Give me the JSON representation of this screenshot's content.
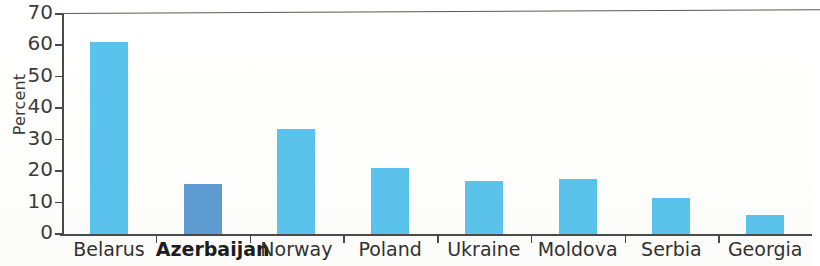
{
  "chart_data": {
    "type": "bar",
    "title": "",
    "xlabel": "",
    "ylabel": "Percent",
    "ylim": [
      0,
      70
    ],
    "ytick_step": 10,
    "yticks": [
      70,
      60,
      50,
      40,
      30,
      20,
      10,
      0
    ],
    "ytick_labels": [
      "70",
      "60",
      "50",
      "40",
      "30",
      "20",
      "10",
      "0"
    ],
    "grid": false,
    "legend": "none",
    "categories": [
      "Belarus",
      "Azerbaijan",
      "Norway",
      "Poland",
      "Ukraine",
      "Moldova",
      "Serbia",
      "Georgia"
    ],
    "values": [
      61,
      16,
      33.5,
      21,
      17,
      17.5,
      11.5,
      6
    ],
    "highlight_category": "Azerbaijan",
    "highlight_index": 1,
    "bar_color": "#5bc2ec",
    "highlight_color": "#5d9bd1",
    "axis_color": "#4a4a49",
    "bars": [
      {
        "category": "Belarus",
        "value": 61,
        "highlighted": false
      },
      {
        "category": "Azerbaijan",
        "value": 16,
        "highlighted": true
      },
      {
        "category": "Norway",
        "value": 33.5,
        "highlighted": false
      },
      {
        "category": "Poland",
        "value": 21,
        "highlighted": false
      },
      {
        "category": "Ukraine",
        "value": 17,
        "highlighted": false
      },
      {
        "category": "Moldova",
        "value": 17.5,
        "highlighted": false
      },
      {
        "category": "Serbia",
        "value": 11.5,
        "highlighted": false
      },
      {
        "category": "Georgia",
        "value": 6,
        "highlighted": false
      }
    ]
  }
}
